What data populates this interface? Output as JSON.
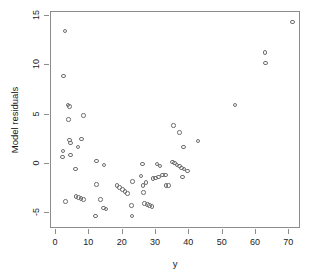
{
  "chart_data": {
    "type": "scatter",
    "title": "",
    "xlabel": "y",
    "ylabel": "Model residuals",
    "xlim": [
      -1.5,
      73.5
    ],
    "ylim": [
      -6.6,
      15.4
    ],
    "xticks": [
      0,
      10,
      20,
      30,
      40,
      50,
      60,
      70
    ],
    "yticks": [
      -5,
      0,
      5,
      10,
      15
    ],
    "grid": false,
    "legend": null,
    "marker": "open-circle",
    "marker_color": "#6f6f6f",
    "frame_color": "#8c8c8c",
    "points": [
      [
        3.0,
        13.4
      ],
      [
        2.6,
        8.8
      ],
      [
        3.9,
        5.9
      ],
      [
        4.3,
        5.7
      ],
      [
        4.1,
        4.4
      ],
      [
        8.6,
        4.8
      ],
      [
        4.4,
        2.3
      ],
      [
        4.6,
        2.0
      ],
      [
        4.7,
        0.8
      ],
      [
        2.4,
        1.2
      ],
      [
        2.2,
        0.6
      ],
      [
        8.0,
        2.4
      ],
      [
        6.9,
        1.6
      ],
      [
        6.2,
        -0.6
      ],
      [
        12.5,
        0.2
      ],
      [
        14.7,
        -0.2
      ],
      [
        3.1,
        -3.9
      ],
      [
        6.3,
        -3.4
      ],
      [
        7.1,
        -3.5
      ],
      [
        7.8,
        -3.6
      ],
      [
        8.5,
        -3.7
      ],
      [
        12.4,
        -2.2
      ],
      [
        13.6,
        -3.7
      ],
      [
        12.1,
        -5.4
      ],
      [
        14.6,
        -4.6
      ],
      [
        15.3,
        -4.7
      ],
      [
        18.6,
        -2.3
      ],
      [
        19.4,
        -2.5
      ],
      [
        20.2,
        -2.7
      ],
      [
        21.0,
        -2.9
      ],
      [
        21.8,
        -3.1
      ],
      [
        23.0,
        -4.3
      ],
      [
        23.1,
        -5.4
      ],
      [
        23.2,
        -1.9
      ],
      [
        25.8,
        -1.3
      ],
      [
        26.3,
        -0.1
      ],
      [
        26.4,
        -2.3
      ],
      [
        26.6,
        -3.0
      ],
      [
        27.3,
        -2.0
      ],
      [
        26.9,
        -4.1
      ],
      [
        27.7,
        -4.2
      ],
      [
        28.4,
        -4.3
      ],
      [
        29.1,
        -4.4
      ],
      [
        29.4,
        -1.6
      ],
      [
        30.2,
        -1.5
      ],
      [
        31.0,
        -1.4
      ],
      [
        30.6,
        -0.1
      ],
      [
        31.5,
        -0.3
      ],
      [
        32.3,
        -1.2
      ],
      [
        33.1,
        -1.2
      ],
      [
        33.3,
        -2.3
      ],
      [
        34.0,
        -2.3
      ],
      [
        35.2,
        0.1
      ],
      [
        35.9,
        0.0
      ],
      [
        36.6,
        -0.2
      ],
      [
        37.3,
        -0.3
      ],
      [
        38.0,
        -0.5
      ],
      [
        38.7,
        -0.6
      ],
      [
        35.5,
        3.8
      ],
      [
        37.4,
        3.1
      ],
      [
        38.6,
        1.6
      ],
      [
        39.8,
        -0.8
      ],
      [
        38.2,
        -1.4
      ],
      [
        42.9,
        2.2
      ],
      [
        54.0,
        5.9
      ],
      [
        63.0,
        11.2
      ],
      [
        63.2,
        10.1
      ],
      [
        71.2,
        14.3
      ]
    ]
  }
}
